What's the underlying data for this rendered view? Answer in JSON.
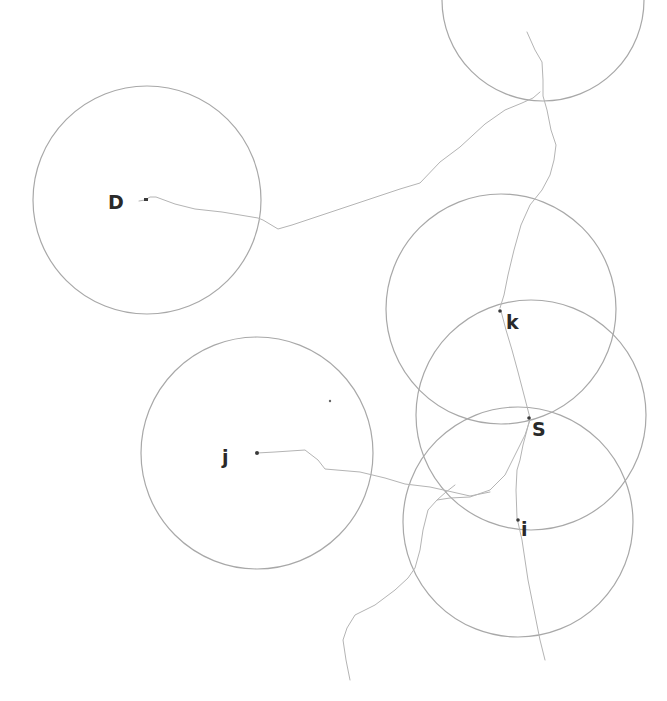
{
  "diagram": {
    "type": "wireless-network-range-diagram",
    "background": "#ffffff",
    "colors": {
      "circle_stroke": "#a8a8a8",
      "path_stroke": "#b4b4b4",
      "node_fill": "#3a3a3a",
      "label_color": "#2a2a2a"
    },
    "nodes": [
      {
        "id": "D",
        "label": "D",
        "x": 147,
        "y": 199,
        "radius": 114,
        "label_x": 108,
        "label_y": 193
      },
      {
        "id": "k",
        "label": "k",
        "x": 501,
        "y": 310,
        "radius": 115,
        "label_x": 506,
        "label_y": 314
      },
      {
        "id": "S",
        "label": "S",
        "x": 530,
        "y": 419,
        "radius": 115,
        "label_x": 532,
        "label_y": 420
      },
      {
        "id": "i",
        "label": "i",
        "x": 518,
        "y": 520,
        "radius": 115,
        "label_x": 521,
        "label_y": 520
      },
      {
        "id": "j",
        "label": "j",
        "x": 257,
        "y": 453,
        "radius": 116,
        "label_x": 221,
        "label_y": 449
      },
      {
        "id": "top",
        "label": "",
        "x": 543,
        "y": 0,
        "radius": 101
      }
    ],
    "stray_points": [
      {
        "x": 330,
        "y": 401
      }
    ]
  }
}
